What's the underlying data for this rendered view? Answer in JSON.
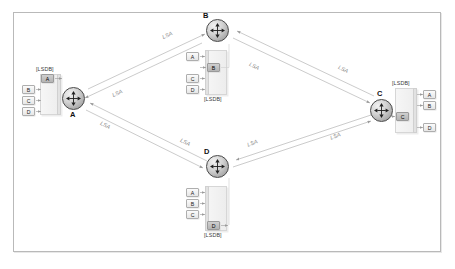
{
  "diagram": {
    "frame_border_color": "#b9b9b9",
    "background_color": "#ffffff",
    "lsa_label_color": "#8a8a8a",
    "chip_self_color": "#b4b4b4"
  },
  "routers": [
    {
      "id": "A",
      "label": "A",
      "lsdb_tag": "[LSDB]",
      "entries": [
        {
          "label": "A",
          "self": true
        },
        {
          "label": "B",
          "self": false
        },
        {
          "label": "C",
          "self": false
        },
        {
          "label": "D",
          "self": false
        }
      ]
    },
    {
      "id": "B",
      "label": "B",
      "lsdb_tag": "[LSDB]",
      "entries": [
        {
          "label": "A",
          "self": false
        },
        {
          "label": "B",
          "self": true
        },
        {
          "label": "C",
          "self": false
        },
        {
          "label": "D",
          "self": false
        }
      ]
    },
    {
      "id": "C",
      "label": "C",
      "lsdb_tag": "[LSDB]",
      "entries": [
        {
          "label": "A",
          "self": false
        },
        {
          "label": "B",
          "self": false
        },
        {
          "label": "C",
          "self": true
        },
        {
          "label": "D",
          "self": false
        }
      ]
    },
    {
      "id": "D",
      "label": "D",
      "lsdb_tag": "[LSDB]",
      "entries": [
        {
          "label": "A",
          "self": false
        },
        {
          "label": "B",
          "self": false
        },
        {
          "label": "C",
          "self": false
        },
        {
          "label": "D",
          "self": true
        }
      ]
    }
  ],
  "links": [
    {
      "from": "A",
      "to": "B",
      "label": "LSA"
    },
    {
      "from": "B",
      "to": "A",
      "label": "LSA"
    },
    {
      "from": "B",
      "to": "C",
      "label": "LSA"
    },
    {
      "from": "C",
      "to": "B",
      "label": "LSA"
    },
    {
      "from": "A",
      "to": "D",
      "label": "LSA"
    },
    {
      "from": "D",
      "to": "A",
      "label": "LSA"
    },
    {
      "from": "D",
      "to": "C",
      "label": "LSA"
    },
    {
      "from": "C",
      "to": "D",
      "label": "LSA"
    }
  ],
  "labels": {
    "lsa_ab": "LSA",
    "lsa_ba": "LSA",
    "lsa_bc": "LSA",
    "lsa_cb": "LSA",
    "lsa_ad": "LSA",
    "lsa_da": "LSA",
    "lsa_dc": "LSA",
    "lsa_cd": "LSA",
    "router_a": "A",
    "router_b": "B",
    "router_c": "C",
    "router_d": "D",
    "lsdb_a": "[LSDB]",
    "lsdb_b": "[LSDB]",
    "lsdb_c": "[LSDB]",
    "lsdb_d": "[LSDB]",
    "a_e1": "A",
    "a_e2": "B",
    "a_e3": "C",
    "a_e4": "D",
    "b_e1": "A",
    "b_e2": "B",
    "b_e3": "C",
    "b_e4": "D",
    "c_e1": "A",
    "c_e2": "B",
    "c_e3": "C",
    "c_e4": "D",
    "d_e1": "A",
    "d_e2": "B",
    "d_e3": "C",
    "d_e4": "D"
  }
}
